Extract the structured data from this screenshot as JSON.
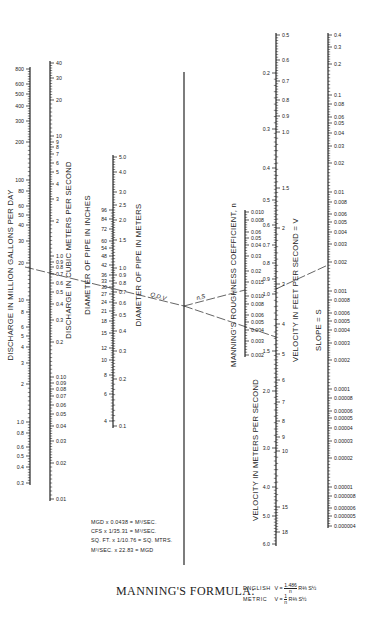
{
  "diagram": {
    "type": "nomograph",
    "scales": [
      {
        "id": "discharge_mgd",
        "title": "DISCHARGE IN MILLION GALLONS PER DAY",
        "side": "left",
        "x": 30,
        "labels": [
          {
            "v": "800",
            "y": 69
          },
          {
            "v": "600",
            "y": 84
          },
          {
            "v": "500",
            "y": 94
          },
          {
            "v": "400",
            "y": 106
          },
          {
            "v": "300",
            "y": 121
          },
          {
            "v": "200",
            "y": 142
          },
          {
            "v": "100",
            "y": 180
          },
          {
            "v": "80",
            "y": 191
          },
          {
            "v": "60",
            "y": 206
          },
          {
            "v": "50",
            "y": 215
          },
          {
            "v": "40",
            "y": 225
          },
          {
            "v": "30",
            "y": 241
          },
          {
            "v": "20",
            "y": 263
          },
          {
            "v": "10",
            "y": 300
          },
          {
            "v": "8",
            "y": 312
          },
          {
            "v": "6",
            "y": 327
          },
          {
            "v": "5",
            "y": 336
          },
          {
            "v": "4",
            "y": 347
          },
          {
            "v": "3",
            "y": 363
          },
          {
            "v": "2",
            "y": 384
          },
          {
            "v": "1.0",
            "y": 422
          },
          {
            "v": "0.8",
            "y": 433
          },
          {
            "v": "0.6",
            "y": 447
          },
          {
            "v": "0.5",
            "y": 456
          },
          {
            "v": "0.4",
            "y": 467
          },
          {
            "v": "0.3",
            "y": 483
          }
        ],
        "range": [
          0.25,
          900
        ],
        "y_range": [
          490,
          62
        ]
      },
      {
        "id": "discharge_cms",
        "title": "DISCHARGE IN CUBIC METERS PER SECOND",
        "side": "right",
        "x": 50,
        "labels": [
          {
            "v": "40",
            "y": 63
          },
          {
            "v": "30",
            "y": 78
          },
          {
            "v": "20",
            "y": 100
          },
          {
            "v": "10",
            "y": 136
          },
          {
            "v": "9",
            "y": 142
          },
          {
            "v": "8",
            "y": 147
          },
          {
            "v": "7",
            "y": 154
          },
          {
            "v": "6",
            "y": 163
          },
          {
            "v": "5",
            "y": 172
          },
          {
            "v": "4",
            "y": 184
          },
          {
            "v": "3",
            "y": 199
          },
          {
            "v": "2",
            "y": 221
          },
          {
            "v": "1.0",
            "y": 256
          },
          {
            "v": "0.9",
            "y": 262
          },
          {
            "v": "0.8",
            "y": 267
          },
          {
            "v": "0.7",
            "y": 274
          },
          {
            "v": "0.6",
            "y": 283
          },
          {
            "v": "0.5",
            "y": 292
          },
          {
            "v": "0.4",
            "y": 304
          },
          {
            "v": "0.3",
            "y": 320
          },
          {
            "v": "0.2",
            "y": 342
          },
          {
            "v": "0.10",
            "y": 377
          },
          {
            "v": "0.09",
            "y": 383
          },
          {
            "v": "0.08",
            "y": 389
          },
          {
            "v": "0.07",
            "y": 396
          },
          {
            "v": "0.06",
            "y": 405
          },
          {
            "v": "0.05",
            "y": 414
          },
          {
            "v": "0.04",
            "y": 426
          },
          {
            "v": "0.03",
            "y": 441
          },
          {
            "v": "0.02",
            "y": 463
          },
          {
            "v": "0.01",
            "y": 499
          }
        ]
      },
      {
        "id": "diameter_in",
        "title": "DIAMETER OF PIPE IN INCHES",
        "side": "left",
        "x": 113,
        "labels": [
          {
            "v": "96",
            "y": 210
          },
          {
            "v": "84",
            "y": 219
          },
          {
            "v": "72",
            "y": 229
          },
          {
            "v": "60",
            "y": 241
          },
          {
            "v": "54",
            "y": 248
          },
          {
            "v": "48",
            "y": 256
          },
          {
            "v": "42",
            "y": 265
          },
          {
            "v": "36",
            "y": 275
          },
          {
            "v": "33",
            "y": 281
          },
          {
            "v": "30",
            "y": 287
          },
          {
            "v": "27",
            "y": 294
          },
          {
            "v": "24",
            "y": 302
          },
          {
            "v": "21",
            "y": 311
          },
          {
            "v": "18",
            "y": 321
          },
          {
            "v": "15",
            "y": 333
          },
          {
            "v": "12",
            "y": 348
          },
          {
            "v": "10",
            "y": 360
          },
          {
            "v": "8",
            "y": 375
          },
          {
            "v": "6",
            "y": 394
          },
          {
            "v": "4",
            "y": 421
          }
        ]
      },
      {
        "id": "diameter_m",
        "title": "DIAMETER OF PIPE IN METERS",
        "side": "right",
        "x": 113,
        "labels": [
          {
            "v": "5.0",
            "y": 157
          },
          {
            "v": "4.0",
            "y": 172
          },
          {
            "v": "3.0",
            "y": 192
          },
          {
            "v": "2.5",
            "y": 205
          },
          {
            "v": "2.0",
            "y": 220
          },
          {
            "v": "1.5",
            "y": 240
          },
          {
            "v": "1.0",
            "y": 268
          },
          {
            "v": "0.9",
            "y": 275
          },
          {
            "v": "0.8",
            "y": 283
          },
          {
            "v": "0.7",
            "y": 292
          },
          {
            "v": "0.6",
            "y": 303
          },
          {
            "v": "0.5",
            "y": 315
          },
          {
            "v": "0.4",
            "y": 331
          },
          {
            "v": "0.3",
            "y": 351
          },
          {
            "v": "0.2",
            "y": 379
          },
          {
            "v": "0.1",
            "y": 426
          }
        ]
      },
      {
        "id": "turning_line",
        "title": "",
        "x": 184,
        "y_range": [
          72,
          565
        ]
      },
      {
        "id": "roughness_n",
        "title": "MANNING'S ROUGHNESS COEFFICIENT, n",
        "side": "right",
        "x": 245,
        "labels": [
          {
            "v": "0.010",
            "y": 212
          },
          {
            "v": "0.008",
            "y": 220
          },
          {
            "v": "0.06",
            "y": 232
          },
          {
            "v": "0.05",
            "y": 238
          },
          {
            "v": "0.04",
            "y": 245
          },
          {
            "v": "0.03",
            "y": 256
          },
          {
            "v": "0.02",
            "y": 271
          },
          {
            "v": "0.015",
            "y": 282
          },
          {
            "v": "0.010",
            "y": 296
          },
          {
            "v": "0.008",
            "y": 304
          },
          {
            "v": "0.006",
            "y": 315
          },
          {
            "v": "0.005",
            "y": 322
          },
          {
            "v": "0.004",
            "y": 330
          },
          {
            "v": "0.003",
            "y": 341
          },
          {
            "v": "0.002",
            "y": 355
          }
        ]
      },
      {
        "id": "velocity_mps",
        "title": "VELOCITY IN METERS PER SECOND",
        "side": "left",
        "x": 276,
        "labels": [
          {
            "v": "0.2",
            "y": 73
          },
          {
            "v": "0.3",
            "y": 129
          },
          {
            "v": "0.4",
            "y": 168
          },
          {
            "v": "0.5",
            "y": 200
          },
          {
            "v": "0.6",
            "y": 225
          },
          {
            "v": "0.7",
            "y": 245
          },
          {
            "v": "0.8",
            "y": 263
          },
          {
            "v": "0.9",
            "y": 279
          },
          {
            "v": "1.0",
            "y": 294
          },
          {
            "v": "1.5",
            "y": 351
          },
          {
            "v": "2.0",
            "y": 391
          },
          {
            "v": "3.0",
            "y": 448
          },
          {
            "v": "4.0",
            "y": 487
          },
          {
            "v": "5.0",
            "y": 516
          },
          {
            "v": "6.0",
            "y": 544
          }
        ]
      },
      {
        "id": "velocity_fps",
        "title": "VELOCITY IN FEET PER SECOND = V",
        "side": "right",
        "x": 276,
        "labels": [
          {
            "v": "0.5",
            "y": 35
          },
          {
            "v": "0.6",
            "y": 60
          },
          {
            "v": "0.7",
            "y": 81
          },
          {
            "v": "0.8",
            "y": 100
          },
          {
            "v": "0.9",
            "y": 116
          },
          {
            "v": "1.0",
            "y": 132
          },
          {
            "v": "1.5",
            "y": 188
          },
          {
            "v": "2",
            "y": 228
          },
          {
            "v": "3",
            "y": 284
          },
          {
            "v": "4",
            "y": 324
          },
          {
            "v": "5",
            "y": 354
          },
          {
            "v": "6",
            "y": 380
          },
          {
            "v": "7",
            "y": 402
          },
          {
            "v": "8",
            "y": 421
          },
          {
            "v": "9",
            "y": 437
          },
          {
            "v": "10",
            "y": 451
          },
          {
            "v": "15",
            "y": 507
          },
          {
            "v": "18",
            "y": 532
          }
        ]
      },
      {
        "id": "slope_s",
        "title": "SLOPE = S",
        "side": "right",
        "x": 328,
        "labels": [
          {
            "v": "0.4",
            "y": 35
          },
          {
            "v": "0.3",
            "y": 47
          },
          {
            "v": "0.2",
            "y": 64
          },
          {
            "v": "0.1",
            "y": 95
          },
          {
            "v": "0.08",
            "y": 104
          },
          {
            "v": "0.06",
            "y": 117
          },
          {
            "v": "0.05",
            "y": 123
          },
          {
            "v": "0.04",
            "y": 133
          },
          {
            "v": "0.03",
            "y": 146
          },
          {
            "v": "0.02",
            "y": 163
          },
          {
            "v": "0.01",
            "y": 192
          },
          {
            "v": "0.008",
            "y": 202
          },
          {
            "v": "0.006",
            "y": 214
          },
          {
            "v": "0.005",
            "y": 222
          },
          {
            "v": "0.004",
            "y": 232
          },
          {
            "v": "0.003",
            "y": 244
          },
          {
            "v": "0.002",
            "y": 262
          },
          {
            "v": "0.001",
            "y": 291
          },
          {
            "v": "0.0008",
            "y": 300
          },
          {
            "v": "0.0006",
            "y": 313
          },
          {
            "v": "0.0005",
            "y": 321
          },
          {
            "v": "0.0004",
            "y": 330
          },
          {
            "v": "0.0003",
            "y": 343
          },
          {
            "v": "0.0002",
            "y": 360
          },
          {
            "v": "0.0001",
            "y": 389
          },
          {
            "v": "0.00008",
            "y": 398
          },
          {
            "v": "0.00006",
            "y": 411
          },
          {
            "v": "0.00005",
            "y": 418
          },
          {
            "v": "0.00004",
            "y": 428
          },
          {
            "v": "0.00003",
            "y": 441
          },
          {
            "v": "0.00002",
            "y": 458
          },
          {
            "v": "0.00001",
            "y": 487
          },
          {
            "v": "0.000008",
            "y": 496
          },
          {
            "v": "0.000006",
            "y": 508
          },
          {
            "v": "0.000005",
            "y": 516
          },
          {
            "v": "0.000004",
            "y": 526
          }
        ]
      }
    ],
    "turning_labels": {
      "qdv": "Q,D,V",
      "ns": "n,S"
    },
    "conversion_notes": [
      "MGD x 0.0438 = M³/SEC.",
      "CFS x 1/35.31 = M³/SEC.",
      "SQ. FT. x 1/10.76 = SQ. MTRS.",
      "M³/SEC. x 22.83 = MGD"
    ],
    "formula": {
      "label": "MANNING'S FORMULA:",
      "english_label": "ENGLISH",
      "english_lhs": "V =",
      "english_num": "1.486",
      "english_den": "n",
      "english_rhs": "R⅔ S½",
      "metric_label": "METRIC",
      "metric_lhs": "V =",
      "metric_num": "1",
      "metric_den": "n",
      "metric_rhs": "R⅔ S½"
    }
  }
}
